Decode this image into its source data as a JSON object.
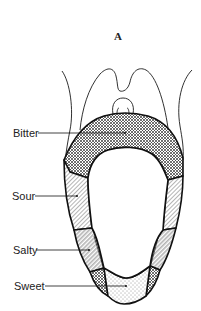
{
  "figure": {
    "title": "A",
    "labels": [
      {
        "id": "bitter",
        "text": "Bitter"
      },
      {
        "id": "sour",
        "text": "Sour"
      },
      {
        "id": "salty",
        "text": "Salty"
      },
      {
        "id": "sweet",
        "text": "Sweet"
      }
    ],
    "colors": {
      "line": "#1a1a1a",
      "background": "#ffffff",
      "bitter_fill": "crosshatch",
      "sour_fill": "diagonal-hatch",
      "salty_fill": "diagonal-hatch",
      "sweet_fill": "stipple"
    }
  }
}
